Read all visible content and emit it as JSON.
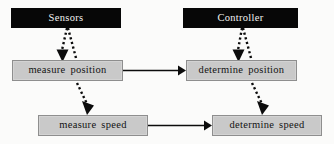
{
  "diagram": {
    "background_color": "#fbfbfa",
    "header_fill": "#070707",
    "header_text_color": "#f2f2f2",
    "process_fill": "#c9c9c9",
    "process_border": "#8e8e8e",
    "process_text_color": "#131313",
    "edge_color": "#0c0c0c",
    "nodes": [
      {
        "id": "sensors",
        "label": "Sensors",
        "type": "header",
        "x": 11,
        "y": 8,
        "w": 110,
        "h": 20
      },
      {
        "id": "controller",
        "label": "Controller",
        "type": "header",
        "x": 183,
        "y": 8,
        "w": 115,
        "h": 20
      },
      {
        "id": "measure-position",
        "label": "measure position",
        "type": "process",
        "x": 12,
        "y": 60,
        "w": 111,
        "h": 21
      },
      {
        "id": "determine-position",
        "label": "determine position",
        "type": "process",
        "x": 186,
        "y": 60,
        "w": 111,
        "h": 21
      },
      {
        "id": "measure-speed",
        "label": "measure speed",
        "type": "process",
        "x": 38,
        "y": 115,
        "w": 110,
        "h": 21
      },
      {
        "id": "determine-speed",
        "label": "determine speed",
        "type": "process",
        "x": 212,
        "y": 115,
        "w": 110,
        "h": 21
      }
    ],
    "edges": [
      {
        "id": "sensors-to-measure-position",
        "from": "sensors",
        "to": "measure-position",
        "style": "dotted"
      },
      {
        "id": "sensors-to-measure-speed",
        "from": "sensors",
        "to": "measure-speed",
        "style": "dotted"
      },
      {
        "id": "controller-to-determine-position",
        "from": "controller",
        "to": "determine-position",
        "style": "dotted"
      },
      {
        "id": "determine-position-to-determine-speed",
        "from": "determine-position",
        "to": "determine-speed",
        "style": "dotted"
      },
      {
        "id": "measure-position-to-determine-position",
        "from": "measure-position",
        "to": "determine-position",
        "style": "solid"
      },
      {
        "id": "measure-speed-to-determine-speed",
        "from": "measure-speed",
        "to": "determine-speed",
        "style": "solid"
      }
    ]
  }
}
